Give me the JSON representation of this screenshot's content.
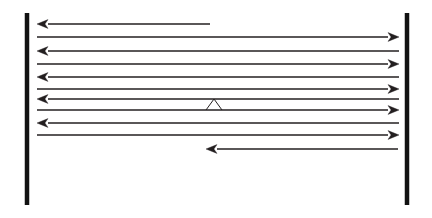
{
  "figure": {
    "type": "diagram",
    "title": "",
    "caption": "",
    "background_color": "#ffffff",
    "canvas": {
      "width": 432,
      "height": 218
    },
    "line_color": "#231f20",
    "bar_color": "#121212"
  },
  "boundaries": [
    {
      "name": "left-boundary-bar",
      "orientation": "vertical",
      "x": 27,
      "y_top": 13,
      "y_bottom": 205,
      "thickness": 4.5,
      "color": "#121212"
    },
    {
      "name": "right-boundary-bar",
      "orientation": "vertical",
      "x": 407,
      "y_top": 13,
      "y_bottom": 205,
      "thickness": 4.5,
      "color": "#121212"
    }
  ],
  "arrows": [
    {
      "id": "arrow-1",
      "direction": "left",
      "y": 24,
      "x_start": 210,
      "x_end": 37,
      "head": "start",
      "truncated": true,
      "thickness": 1.3,
      "color": "#231f20"
    },
    {
      "id": "arrow-2",
      "direction": "right",
      "y": 37,
      "x_start": 37,
      "x_end": 399,
      "head": "end",
      "truncated": false,
      "thickness": 1.3,
      "color": "#231f20"
    },
    {
      "id": "arrow-3",
      "direction": "left",
      "y": 51,
      "x_start": 399,
      "x_end": 37,
      "head": "start",
      "truncated": false,
      "thickness": 1.3,
      "color": "#231f20"
    },
    {
      "id": "arrow-4",
      "direction": "right",
      "y": 64,
      "x_start": 37,
      "x_end": 399,
      "head": "end",
      "truncated": false,
      "thickness": 1.3,
      "color": "#231f20"
    },
    {
      "id": "arrow-5",
      "direction": "left",
      "y": 77,
      "x_start": 399,
      "x_end": 37,
      "head": "start",
      "truncated": false,
      "thickness": 1.3,
      "color": "#231f20"
    },
    {
      "id": "arrow-6",
      "direction": "right",
      "y": 89,
      "x_start": 37,
      "x_end": 399,
      "head": "end",
      "truncated": false,
      "thickness": 1.3,
      "color": "#231f20"
    },
    {
      "id": "arrow-7",
      "direction": "left",
      "y": 99,
      "x_start": 399,
      "x_end": 37,
      "head": "start",
      "truncated": false,
      "thickness": 1.3,
      "color": "#231f20"
    },
    {
      "id": "arrow-8",
      "direction": "right",
      "y": 110,
      "x_start": 37,
      "x_end": 399,
      "head": "end",
      "truncated": false,
      "thickness": 1.3,
      "color": "#231f20"
    },
    {
      "id": "arrow-9",
      "direction": "left",
      "y": 123,
      "x_start": 399,
      "x_end": 37,
      "head": "start",
      "truncated": false,
      "thickness": 1.3,
      "color": "#231f20"
    },
    {
      "id": "arrow-10",
      "direction": "right",
      "y": 135,
      "x_start": 37,
      "x_end": 399,
      "head": "end",
      "truncated": false,
      "thickness": 1.3,
      "color": "#231f20"
    },
    {
      "id": "arrow-11",
      "direction": "left",
      "y": 149,
      "x_start": 398,
      "x_end": 206,
      "head": "start",
      "truncated": true,
      "thickness": 1.3,
      "color": "#231f20"
    }
  ],
  "markers": [
    {
      "id": "caret-marker",
      "shape": "caret-triangle",
      "apex_x": 214,
      "apex_y": 99,
      "left_x": 206,
      "right_x": 222,
      "base_y": 110,
      "color": "#231f20",
      "thickness": 1.0,
      "filled": false
    }
  ],
  "labels": []
}
